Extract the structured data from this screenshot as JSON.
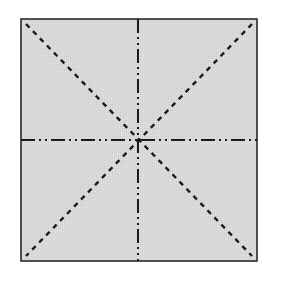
{
  "diagram": {
    "square": {
      "x": 21,
      "y": 19,
      "width": 236,
      "height": 242,
      "fill": "#d6d6d6",
      "stroke": "#2a2a2a"
    },
    "line_color": "#1a1a1a",
    "lines": [
      {
        "id": "diagonal-tl-br",
        "style": "dashed"
      },
      {
        "id": "diagonal-tr-bl",
        "style": "dashed"
      },
      {
        "id": "vertical-center",
        "style": "dash-dot-dot"
      },
      {
        "id": "horizontal-center",
        "style": "dash-dot-dot"
      }
    ],
    "center": {
      "x": 138,
      "y": 140
    }
  }
}
